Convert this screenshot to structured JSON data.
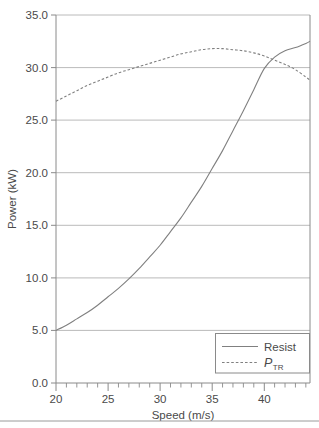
{
  "chart_data": {
    "type": "line",
    "title": "",
    "xlabel": "Speed (m/s)",
    "ylabel": "Power (kW)",
    "xlim": [
      20,
      44.4
    ],
    "ylim": [
      0.0,
      35.0
    ],
    "grid": "horizontal",
    "legend_position": "bottom-right",
    "x_ticks": [
      20,
      25,
      30,
      35,
      40
    ],
    "x_tick_labels": [
      "20",
      "25",
      "30",
      "35",
      "40"
    ],
    "x_minor_tick_step": 1,
    "y_ticks": [
      0.0,
      5.0,
      10.0,
      15.0,
      20.0,
      25.0,
      30.0,
      35.0
    ],
    "y_tick_labels": [
      "0.0",
      "5.0",
      "10.0",
      "15.0",
      "20.0",
      "25.0",
      "30.0",
      "35.0"
    ],
    "series": [
      {
        "name": "Resist",
        "style": "solid",
        "color": "#808080",
        "x": [
          20,
          21,
          22,
          23,
          24,
          25,
          26,
          27,
          28,
          29,
          30,
          31,
          32,
          33,
          34,
          35,
          36,
          37,
          38,
          39,
          40,
          41,
          42,
          43,
          44,
          44.4
        ],
        "values": [
          5.0,
          5.5,
          6.1,
          6.7,
          7.4,
          8.2,
          9.0,
          9.9,
          10.9,
          12.0,
          13.1,
          14.4,
          15.7,
          17.2,
          18.7,
          20.4,
          22.1,
          24.0,
          25.9,
          27.9,
          29.9,
          31.0,
          31.6,
          31.9,
          32.3,
          32.5
        ]
      },
      {
        "name": "P_TR",
        "style": "dashed",
        "color": "#808080",
        "x": [
          20,
          21,
          22,
          23,
          24,
          25,
          26,
          27,
          28,
          29,
          30,
          31,
          32,
          33,
          34,
          35,
          36,
          37,
          38,
          39,
          40,
          41,
          42,
          43,
          44,
          44.4
        ],
        "values": [
          26.8,
          27.3,
          27.8,
          28.3,
          28.7,
          29.1,
          29.5,
          29.8,
          30.1,
          30.4,
          30.7,
          31.0,
          31.3,
          31.5,
          31.7,
          31.8,
          31.8,
          31.7,
          31.6,
          31.4,
          31.1,
          30.7,
          30.3,
          29.8,
          29.1,
          28.8
        ]
      }
    ]
  },
  "axes": {
    "x_title": "Speed (m/s)",
    "y_title": "Power (kW)"
  },
  "legend": {
    "entries": [
      {
        "label": "Resist",
        "style": "solid",
        "is_math": false
      },
      {
        "label": "P",
        "subscript": "TR",
        "style": "dashed",
        "is_math": true
      }
    ]
  },
  "colors": {
    "line": "#808080",
    "grid": "#aaaaaa",
    "axis": "#8a8a8a",
    "text": "#4a4a4a",
    "background": "#ffffff",
    "rule": "#9a9a9a"
  }
}
